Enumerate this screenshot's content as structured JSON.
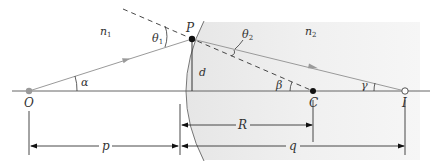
{
  "diagram": {
    "media": {
      "left": {
        "label": "n",
        "subscript": "1"
      },
      "right": {
        "label": "n",
        "subscript": "2"
      }
    },
    "points": {
      "object": "O",
      "refraction_point": "P",
      "center": "C",
      "image": "I"
    },
    "angles": {
      "alpha": "α",
      "beta": "β",
      "gamma": "γ",
      "theta1": {
        "label": "θ",
        "subscript": "1"
      },
      "theta2": {
        "label": "θ",
        "subscript": "2"
      }
    },
    "dimensions": {
      "height": "d",
      "object_distance": "p",
      "radius": "R",
      "image_distance": "q"
    },
    "colors": {
      "ray": "#9a9a9a",
      "line": "#333333",
      "medium2_fill": "#eeeeee",
      "object_dot": "#9a9a9a"
    }
  }
}
